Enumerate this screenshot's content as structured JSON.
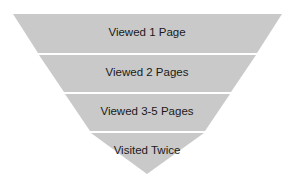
{
  "funnel": {
    "fill_color": "#c9c9c9",
    "stages": [
      {
        "label": "Viewed 1 Page"
      },
      {
        "label": "Viewed 2 Pages"
      },
      {
        "label": "Viewed 3-5 Pages"
      },
      {
        "label": "Visited Twice"
      }
    ]
  }
}
